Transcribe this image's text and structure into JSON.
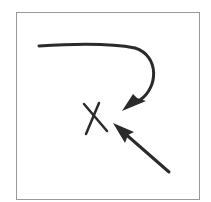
{
  "diagram": {
    "frame": {
      "x": 16,
      "y": 12,
      "width": 183,
      "height": 187,
      "stroke": "#9a9a9a"
    },
    "ink_color": "#2a2a2a",
    "elements": [
      {
        "id": "curved-arrow",
        "type": "curved-arrow",
        "from": [
          39,
          46
        ],
        "to": [
          122,
          110
        ]
      },
      {
        "id": "target-x",
        "type": "x-mark",
        "center": [
          95,
          118
        ]
      },
      {
        "id": "straight-arrow",
        "type": "straight-arrow",
        "from": [
          169,
          172
        ],
        "to": [
          113,
          123
        ]
      }
    ]
  }
}
